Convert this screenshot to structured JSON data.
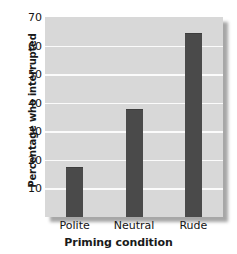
{
  "chart_data": {
    "type": "bar",
    "title": "",
    "subtitle": "",
    "categories": [
      "Polite",
      "Neutral",
      "Rude"
    ],
    "values": [
      17,
      37.5,
      64
    ],
    "xlabel": "Priming condition",
    "ylabel": "Percentage who interrupted",
    "ylim": [
      0,
      70
    ],
    "yticks": [
      70,
      60,
      50,
      40,
      30,
      20,
      10
    ],
    "ytick_labels": [
      "70",
      "60",
      "50",
      "40",
      "30",
      "20",
      "10"
    ],
    "grid": true,
    "grid_orientation": "horizontal",
    "legend": false,
    "legend_position": "none",
    "annotations": [],
    "colors": {
      "bar": "#4a4a4a",
      "plot_background": "#d8d8d8",
      "gridline": "#fbfbfb",
      "page_background": "#ffffff",
      "text": "#141414",
      "shadow": "#6e6e6e"
    }
  }
}
